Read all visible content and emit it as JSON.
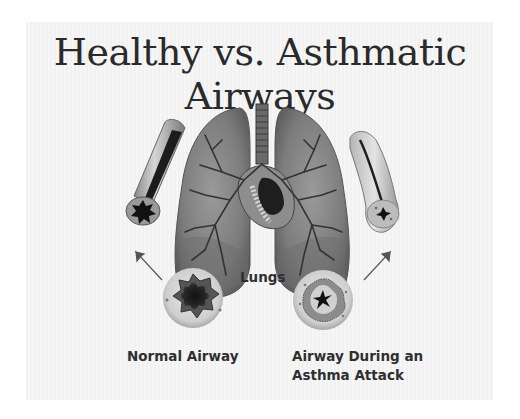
{
  "title": "Healthy vs. Asthmatic Airways",
  "labels": {
    "lungs": "Lungs",
    "normal_airway": "Normal Airway",
    "asthma_airway_line1": "Airway During an",
    "asthma_airway_line2": "Asthma Attack"
  },
  "figures": [
    {
      "name": "normal-airway-tube",
      "description": "Cutaway tube of a healthy airway with open lumen"
    },
    {
      "name": "normal-airway-cross-section",
      "description": "Cross-section showing wide open star-shaped lumen"
    },
    {
      "name": "lungs",
      "description": "Pair of lungs with trachea, bronchial tree and heart"
    },
    {
      "name": "asthma-airway-tube",
      "description": "Cutaway tube of a constricted, inflamed airway"
    },
    {
      "name": "asthma-airway-cross-section",
      "description": "Cross-section showing narrowed lumen with mucus"
    }
  ],
  "colors": {
    "background": "#ffffff",
    "panel": "#f3f3f3",
    "text": "#2f2f2f",
    "lung": "#8a8a8a",
    "lung_dark": "#5a5a5a"
  }
}
